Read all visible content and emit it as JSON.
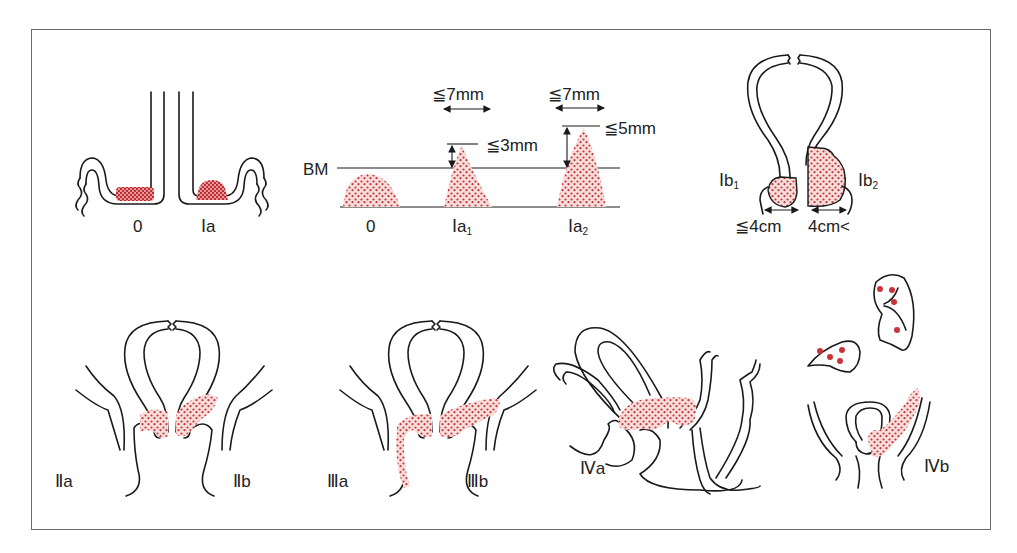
{
  "figure": {
    "tumor_color": "#c8343a",
    "tumor_fill": "#f6d9d6",
    "line_color": "#1a1a1a",
    "frame_color": "#6a6a6a"
  },
  "panels": {
    "stage0_Ia": {
      "labels": [
        "0",
        "Ⅰa"
      ]
    },
    "microinvasion": {
      "bm_label": "BM",
      "stages": [
        {
          "label": "0",
          "sub": ""
        },
        {
          "label": "Ⅰa",
          "sub": "1",
          "width": "≦7mm",
          "depth": "≦3mm"
        },
        {
          "label": "Ⅰa",
          "sub": "2",
          "width": "≦7mm",
          "depth": "≦5mm"
        }
      ]
    },
    "stage_Ib": {
      "left_label": "Ⅰb",
      "left_sub": "1",
      "left_size": "≦4cm",
      "right_label": "Ⅰb",
      "right_sub": "2",
      "right_size": "4cm<"
    },
    "stage_II": {
      "left_label": "Ⅱa",
      "right_label": "Ⅱb"
    },
    "stage_III": {
      "left_label": "Ⅲa",
      "right_label": "Ⅲb"
    },
    "stage_IVa": {
      "label": "Ⅳa"
    },
    "stage_IVb": {
      "label": "Ⅳb"
    }
  }
}
